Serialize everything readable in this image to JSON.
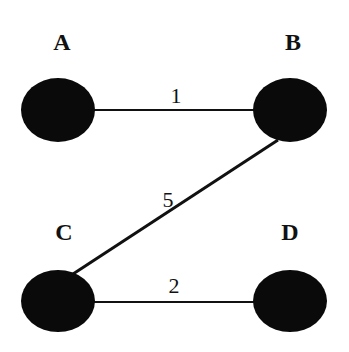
{
  "graph": {
    "nodes": [
      {
        "id": "A",
        "label": "A",
        "cx": 58,
        "cy": 110,
        "lx": 62,
        "ly": 50
      },
      {
        "id": "B",
        "label": "B",
        "cx": 290,
        "cy": 110,
        "lx": 293,
        "ly": 50
      },
      {
        "id": "C",
        "label": "C",
        "cx": 58,
        "cy": 300,
        "lx": 64,
        "ly": 240
      },
      {
        "id": "D",
        "label": "D",
        "cx": 290,
        "cy": 300,
        "lx": 290,
        "ly": 240
      }
    ],
    "edges": [
      {
        "from": "A",
        "to": "B",
        "weight": "1"
      },
      {
        "from": "B",
        "to": "C",
        "weight": "5"
      },
      {
        "from": "C",
        "to": "D",
        "weight": "2"
      }
    ]
  },
  "colors": {
    "node": "#0a0a0a",
    "edge": "#111111",
    "background": "#ffffff"
  }
}
